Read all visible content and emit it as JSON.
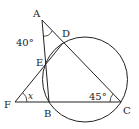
{
  "diagram": {
    "type": "geometry",
    "points": {
      "A": {
        "label": "A",
        "x": 42,
        "y": 20
      },
      "B": {
        "label": "B",
        "x": 49,
        "y": 102
      },
      "C": {
        "label": "C",
        "x": 121,
        "y": 102
      },
      "D": {
        "label": "D",
        "x": 63,
        "y": 43
      },
      "E": {
        "label": "E",
        "x": 45,
        "y": 65
      },
      "F": {
        "label": "F",
        "x": 15,
        "y": 102
      }
    },
    "circle": {
      "cx": 85,
      "cy": 79.5,
      "r": 42.5
    },
    "angles": {
      "A": "40°",
      "C": "45°",
      "F": "x"
    }
  }
}
